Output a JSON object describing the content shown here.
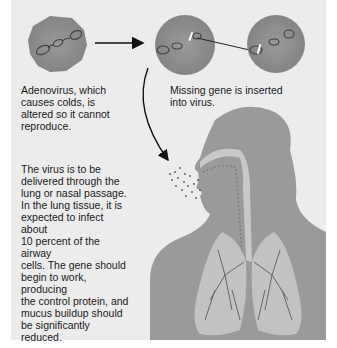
{
  "figure": {
    "captions": {
      "adenovirus": "Adenovirus, which\ncauses colds, is\naltered so it cannot\nreproduce.",
      "gene_insertion": "Missing gene is inserted\ninto virus.",
      "delivery": "The virus is to be\ndelivered through the\nlung or nasal passage.\nIn the lung tissue, it is\nexpected to infect about\n10 percent of the airway\ncells. The gene should\nbegin to work, producing\nthe control protein, and\nmucus buildup should\nbe significantly reduced."
    },
    "elements": [
      {
        "id": "virus-1",
        "label": "altered adenovirus"
      },
      {
        "id": "virus-2",
        "label": "virus receiving gene"
      },
      {
        "id": "virus-3",
        "label": "virus with gene"
      },
      {
        "id": "human-silhouette",
        "label": "head, airway and lungs"
      },
      {
        "id": "spray",
        "label": "virus spray into nose/mouth"
      }
    ],
    "colors": {
      "panel": "#ececec",
      "virus": "#8a8a8a",
      "body": "#999999",
      "airway": "#c8c8c8",
      "text": "#1a1a1a"
    }
  }
}
